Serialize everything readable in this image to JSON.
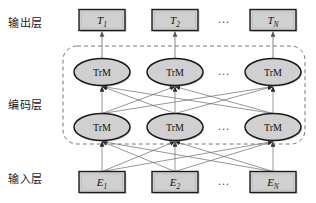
{
  "figure": {
    "background_color": "#ffffff",
    "node_fill": "#d0d0d0",
    "node_stroke": "#1a1a1a",
    "edge_color": "#555555",
    "dashed_border_color": "#777777"
  },
  "layers": {
    "output": {
      "label": "输出层",
      "nodes": [
        {
          "base": "T",
          "sub": "1"
        },
        {
          "base": "T",
          "sub": "2"
        },
        {
          "base": "T",
          "sub": "N"
        }
      ],
      "ellipsis": "..."
    },
    "encoder": {
      "label": "编码层",
      "rows": [
        {
          "nodes": [
            "TrM",
            "TrM",
            "TrM"
          ],
          "ellipsis": "..."
        },
        {
          "nodes": [
            "TrM",
            "TrM",
            "TrM"
          ],
          "ellipsis": "..."
        }
      ]
    },
    "input": {
      "label": "输入层",
      "nodes": [
        {
          "base": "E",
          "sub": "1"
        },
        {
          "base": "E",
          "sub": "2"
        },
        {
          "base": "E",
          "sub": "N"
        }
      ],
      "ellipsis": "..."
    }
  },
  "geometry": {
    "columns_x": [
      102,
      175,
      273
    ],
    "output_box_y": 20,
    "encoder_top_y": 72,
    "encoder_bottom_y": 127,
    "input_box_y": 182,
    "dashed_box": {
      "x": 63,
      "y": 46,
      "width": 242,
      "height": 98
    },
    "ellipsis_x": 224
  }
}
